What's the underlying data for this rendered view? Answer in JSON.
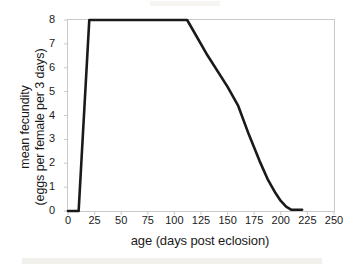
{
  "chart_data": {
    "type": "line",
    "title": "",
    "subtitle": "",
    "xlabel": "age (days post eclosion)",
    "ylabel": "mean fecundity (eggs per female per 3 days)",
    "ylabel_line1": "mean fecundity",
    "ylabel_line2": "(eggs per female per 3 days)",
    "xlim": [
      0,
      250
    ],
    "ylim": [
      0,
      8
    ],
    "xticks": [
      0,
      25,
      50,
      75,
      100,
      125,
      150,
      175,
      200,
      225,
      250
    ],
    "yticks": [
      0,
      1,
      2,
      3,
      4,
      5,
      6,
      7,
      8
    ],
    "xtick_labels": [
      "0",
      "25",
      "50",
      "75",
      "100",
      "125",
      "150",
      "175",
      "200",
      "225",
      "250"
    ],
    "ytick_labels": [
      "0",
      "1",
      "2",
      "3",
      "4",
      "5",
      "6",
      "7",
      "8"
    ],
    "grid": false,
    "legend": false,
    "legend_position": "none",
    "line_color": "#1a1a1a",
    "frame_color": "#c8c8c4",
    "background_color": "#ffffff",
    "series": [
      {
        "name": "mean fecundity",
        "x": [
          0,
          10,
          20,
          112,
          130,
          150,
          160,
          170,
          180,
          188,
          195,
          200,
          205,
          210,
          220
        ],
        "y": [
          0,
          0,
          8,
          8,
          6.6,
          5.2,
          4.4,
          3.2,
          2.1,
          1.3,
          0.75,
          0.42,
          0.18,
          0.05,
          0.05
        ]
      }
    ],
    "annotations": []
  }
}
